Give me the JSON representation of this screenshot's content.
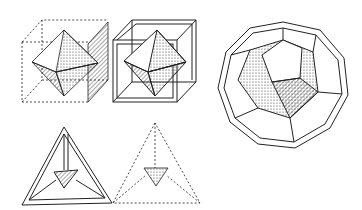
{
  "figure": {
    "items": [
      {
        "name": "octahedron-in-dashed-cube"
      },
      {
        "name": "octahedron-in-framed-cube"
      },
      {
        "name": "framed-dodecahedron"
      },
      {
        "name": "framed-tetrahedron"
      },
      {
        "name": "dashed-tetrahedron"
      }
    ],
    "colors": {
      "ink": "#1a1a1a",
      "paper": "#ffffff"
    }
  }
}
